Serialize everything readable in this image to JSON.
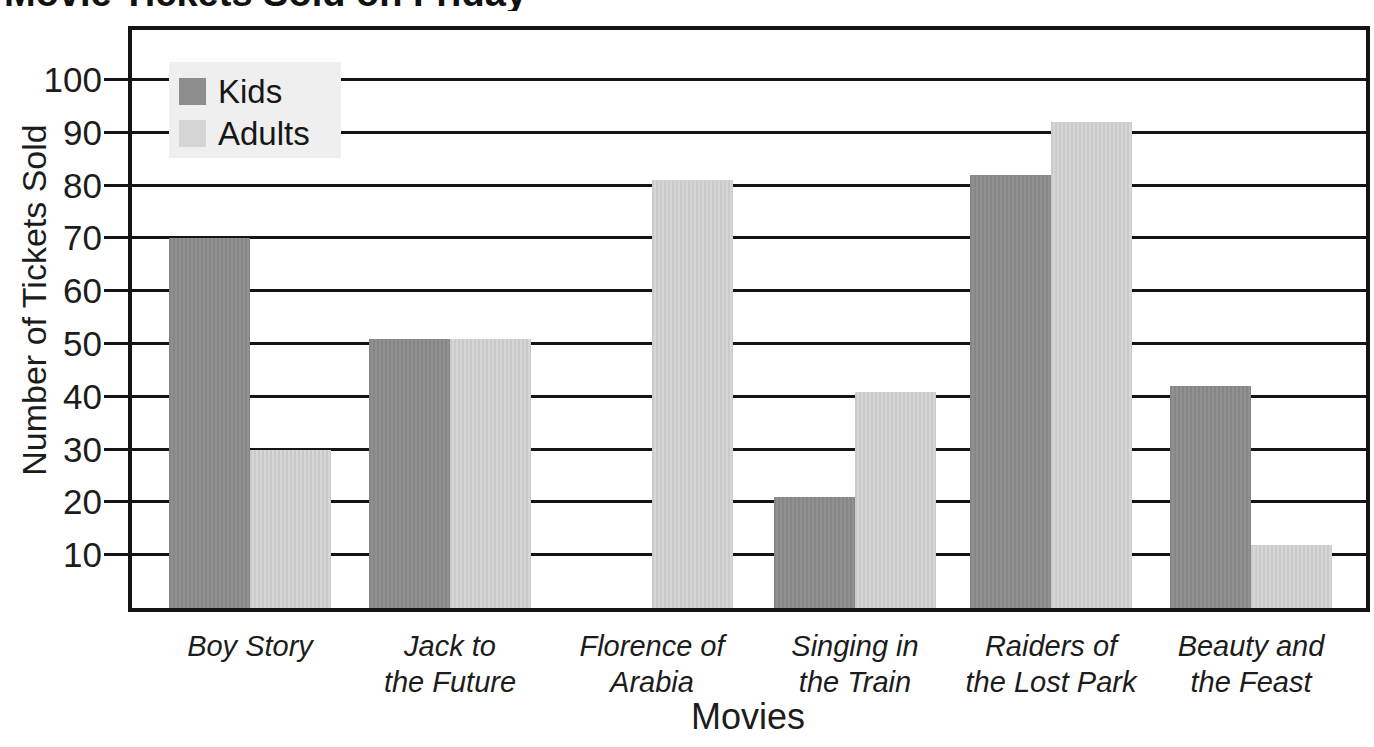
{
  "chart_data": {
    "type": "bar",
    "title": "Movie Tickets Sold on Friday",
    "xlabel": "Movies",
    "ylabel": "Number of Tickets Sold",
    "ylim": [
      0,
      110
    ],
    "yticks": [
      10,
      20,
      30,
      40,
      50,
      60,
      70,
      80,
      90,
      100
    ],
    "grid": "horizontal",
    "legend_position": "top-left",
    "categories": [
      "Boy Story",
      "Jack to the Future",
      "Florence of Arabia",
      "Singing in the Train",
      "Raiders of the Lost Park",
      "Beauty and the Feast"
    ],
    "category_label_lines": [
      [
        "Boy Story"
      ],
      [
        "Jack to",
        "the Future"
      ],
      [
        "Florence of",
        "Arabia"
      ],
      [
        "Singing in",
        "the Train"
      ],
      [
        "Raiders of",
        "the Lost Park"
      ],
      [
        "Beauty and",
        "the Feast"
      ]
    ],
    "series": [
      {
        "name": "Kids",
        "color": "#8d8d8d",
        "values": [
          70,
          51,
          0,
          21,
          82,
          42
        ]
      },
      {
        "name": "Adults",
        "color": "#d5d5d5",
        "values": [
          30,
          51,
          81,
          41,
          92,
          12
        ]
      }
    ]
  },
  "colors": {
    "grid": "#141414",
    "legend_background": "#efefef",
    "text": "#1c1c1c"
  }
}
